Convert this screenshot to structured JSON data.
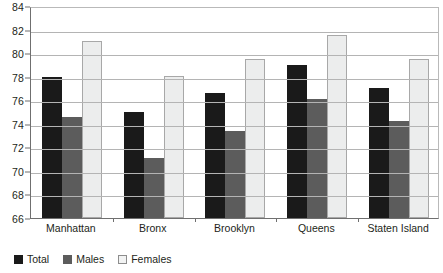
{
  "chart_data": {
    "type": "bar",
    "title": "",
    "subtitle": "",
    "xlabel": "",
    "ylabel": "",
    "ylim": [
      66,
      84
    ],
    "ytick_step": 2,
    "yticks": [
      66,
      68,
      70,
      72,
      74,
      76,
      78,
      80,
      82,
      84
    ],
    "ytick_labels": [
      "66",
      "68",
      "70",
      "72",
      "74",
      "76",
      "78",
      "80",
      "82",
      "84"
    ],
    "grid": true,
    "grid_axis": "y",
    "legend_position": "bottom-left",
    "categories": [
      "Manhattan",
      "Bronx",
      "Brooklyn",
      "Queens",
      "Staten Island"
    ],
    "series": [
      {
        "name": "Total",
        "color": "#1a1a1a",
        "values": [
          78.0,
          75.0,
          76.6,
          79.0,
          77.0
        ]
      },
      {
        "name": "Males",
        "color": "#5c5c5c",
        "values": [
          74.6,
          71.1,
          73.4,
          76.1,
          74.2
        ]
      },
      {
        "name": "Females",
        "color": "#eceded",
        "values": [
          81.0,
          78.1,
          79.5,
          81.5,
          79.5
        ]
      }
    ]
  },
  "legend": {
    "items": [
      {
        "label": "Total",
        "swatch": "total"
      },
      {
        "label": "Males",
        "swatch": "males"
      },
      {
        "label": "Females",
        "swatch": "females"
      }
    ]
  }
}
